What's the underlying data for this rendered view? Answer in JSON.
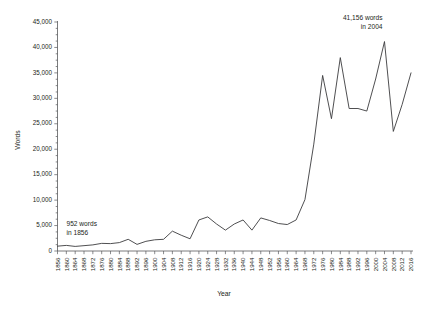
{
  "chart_data": {
    "type": "line",
    "title": "",
    "xlabel": "Year",
    "ylabel": "Words",
    "ylim": [
      0,
      45000
    ],
    "xlim": [
      1856,
      2016
    ],
    "grid": false,
    "legend": null,
    "ytick_labels": [
      "0",
      "5,000",
      "10,000",
      "15,000",
      "20,000",
      "25,000",
      "30,000",
      "35,000",
      "40,000",
      "45,000"
    ],
    "ytick_values": [
      0,
      5000,
      10000,
      15000,
      20000,
      25000,
      30000,
      35000,
      40000,
      45000
    ],
    "xtick_labels": [
      "1856",
      "1860",
      "1864",
      "1868",
      "1872",
      "1876",
      "1880",
      "1884",
      "1888",
      "1892",
      "1896",
      "1900",
      "1904",
      "1908",
      "1912",
      "1916",
      "1920",
      "1924",
      "1928",
      "1932",
      "1936",
      "1940",
      "1944",
      "1948",
      "1952",
      "1956",
      "1960",
      "1964",
      "1968",
      "1972",
      "1976",
      "1980",
      "1984",
      "1988",
      "1992",
      "1996",
      "2000",
      "2004",
      "2008",
      "2012",
      "2016"
    ],
    "x": [
      1856,
      1860,
      1864,
      1868,
      1872,
      1876,
      1880,
      1884,
      1888,
      1892,
      1896,
      1900,
      1904,
      1908,
      1912,
      1916,
      1920,
      1924,
      1928,
      1932,
      1936,
      1940,
      1944,
      1948,
      1952,
      1956,
      1960,
      1964,
      1968,
      1972,
      1976,
      1980,
      1984,
      1988,
      1992,
      1996,
      2000,
      2004,
      2008,
      2012,
      2016
    ],
    "values": [
      952,
      1100,
      900,
      1050,
      1200,
      1500,
      1450,
      1650,
      2300,
      1300,
      1900,
      2200,
      2300,
      3900,
      3100,
      2400,
      6100,
      6700,
      5300,
      4100,
      5300,
      6100,
      4100,
      6500,
      6000,
      5400,
      5200,
      6100,
      10100,
      21000,
      34500,
      26000,
      38000,
      28000,
      28000,
      27500,
      33800,
      41156,
      23500,
      28800,
      35000
    ],
    "annotations": [
      {
        "id": "first-point",
        "line1": "952 words",
        "line2": "in 1856",
        "year": 1856,
        "value": 952
      },
      {
        "id": "peak-point",
        "line1": "41,156 words",
        "line2": "in 2004",
        "year": 2004,
        "value": 41156
      }
    ],
    "colors": {
      "line": "#3b3b3d",
      "axis": "#58595b",
      "text": "#231f20",
      "background": "#ffffff"
    }
  }
}
